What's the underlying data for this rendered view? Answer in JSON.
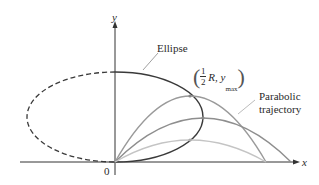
{
  "figure": {
    "axes": {
      "x_label": "x",
      "y_label": "y",
      "origin_label": "0"
    },
    "labels": {
      "ellipse": "Ellipse",
      "point_frac_num": "1",
      "point_frac_den": "2",
      "point_rest": "R, y",
      "point_sub": "max",
      "parabolic_line1": "Parabolic",
      "parabolic_line2": "trajectory"
    },
    "colors": {
      "axis": "#333333",
      "ellipse": "#3a3a3a",
      "trajectory_high": "#9a9a9a",
      "trajectory_mid": "#8e8e8e",
      "trajectory_low": "#c4c4c4"
    }
  }
}
